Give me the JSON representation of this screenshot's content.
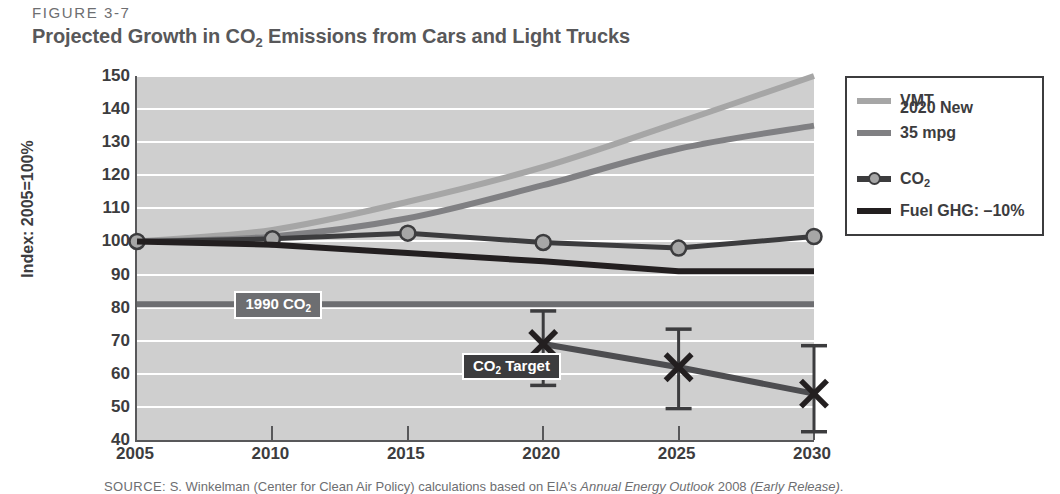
{
  "figure": {
    "label": "FIGURE 3-7",
    "title_part1": "Projected Growth in CO",
    "title_sub": "2",
    "title_part2": " Emissions from Cars and Light Trucks"
  },
  "source": {
    "prefix": "SOURCE:",
    "text_a": " S. Winkelman (Center for Clean Air Policy) calculations based on EIA's ",
    "italic_a": "Annual Energy Outlook",
    "text_b": " 2008 ",
    "italic_b": "(Early Release)",
    "text_c": "."
  },
  "legend": {
    "items": [
      {
        "label": "VMT",
        "style": "line",
        "color": "#a6a6a6"
      },
      {
        "label": "2020 New",
        "label2": "35 mpg",
        "style": "line",
        "color": "#808083"
      },
      {
        "label": "CO",
        "sub": "2",
        "style": "line-marker",
        "color": "#3c3c3e",
        "marker_fill": "#a6a6a6"
      },
      {
        "label": "Fuel GHG: –10%",
        "style": "line",
        "color": "#231f20"
      }
    ]
  },
  "annotations": [
    {
      "id": "annot-1990",
      "text": "1990 CO",
      "sub": "2",
      "bg": "#6d6e71"
    },
    {
      "id": "annot-target",
      "text": "CO",
      "sub": "2",
      "text2": " Target",
      "bg": "#3c3c3e"
    }
  ],
  "chart_data": {
    "type": "line",
    "title": "Projected Growth in CO2 Emissions from Cars and Light Trucks",
    "xlabel": "",
    "ylabel": "Index: 2005=100%",
    "x": [
      2005,
      2010,
      2015,
      2020,
      2025,
      2030
    ],
    "xticks": [
      "2005",
      "2010",
      "2015",
      "2020",
      "2025",
      "2030"
    ],
    "yticks": [
      40,
      50,
      60,
      70,
      80,
      90,
      100,
      110,
      120,
      130,
      140,
      150
    ],
    "xlim": [
      2005,
      2030
    ],
    "ylim": [
      40,
      150
    ],
    "grid": "horizontal-white",
    "plot_background": "#cfcfcf",
    "legend_position": "outside-right-top",
    "series": [
      {
        "name": "VMT",
        "color": "#a6a6a6",
        "width": 6,
        "values": [
          100,
          103.5,
          112,
          122.5,
          136,
          150
        ],
        "markers": false
      },
      {
        "name": "2020 New 35 mpg",
        "color": "#808083",
        "width": 6,
        "values": [
          100,
          101.5,
          107,
          117,
          128,
          135
        ],
        "markers": false
      },
      {
        "name": "CO2",
        "color": "#3c3c3e",
        "width": 5,
        "values": [
          100,
          100.8,
          102.5,
          99.7,
          98,
          101.5
        ],
        "markers": true,
        "marker_fill": "#a6a6a6",
        "marker_edge": "#3c3c3e"
      },
      {
        "name": "Fuel GHG: -10%",
        "color": "#231f20",
        "width": 6,
        "values": [
          100,
          99,
          96.5,
          94,
          91,
          91
        ],
        "markers": false
      },
      {
        "name": "CO2 Target",
        "color": "#4d4d50",
        "width": 6,
        "x": [
          2020,
          2025,
          2030
        ],
        "values": [
          69,
          62,
          54
        ],
        "marker_style": "x",
        "error_bars": {
          "upper": [
            79,
            73.5,
            68.5
          ],
          "lower": [
            56.5,
            49.5,
            42.5
          ]
        }
      }
    ],
    "reference_lines": [
      {
        "name": "1990 CO2",
        "value": 81,
        "color": "#6d6e71",
        "width": 6
      }
    ],
    "annotations": [
      {
        "text": "1990 CO2",
        "x": 2008.6,
        "y": 81,
        "style": "white-on-gray-box"
      },
      {
        "text": "CO2 Target",
        "x": 2017.0,
        "y": 62.5,
        "style": "white-on-dark-box"
      }
    ]
  }
}
